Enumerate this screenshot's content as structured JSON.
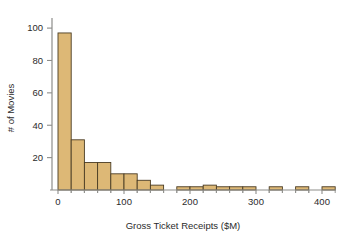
{
  "chart_data": {
    "type": "bar",
    "title": "",
    "subtitle": "",
    "xlabel": "Gross Ticket Receipts ($M)",
    "ylabel": "# of Movies",
    "xlim": [
      -10,
      430
    ],
    "ylim": [
      0,
      105
    ],
    "xticks": [
      0,
      100,
      200,
      300,
      400
    ],
    "xticklabels": [
      "0",
      "100",
      "200",
      "300",
      "400"
    ],
    "yticks": [
      20,
      40,
      60,
      80,
      100
    ],
    "yticklabels": [
      "20",
      "40",
      "60",
      "80",
      "100"
    ],
    "grid": false,
    "legend": null,
    "bin_width": 20,
    "bar_fill_color": "#ddb876",
    "bar_edge_color": "#4a3c24",
    "axis_color": "#8d8d8a",
    "text_color": "#2b2b2b",
    "background_color": "#ffffff",
    "categories": [
      "0-20",
      "20-40",
      "40-60",
      "60-80",
      "80-100",
      "100-120",
      "120-140",
      "140-160",
      "160-180",
      "180-200",
      "200-220",
      "220-240",
      "240-260",
      "260-280",
      "280-300",
      "300-320",
      "320-340",
      "340-360",
      "360-380",
      "380-400",
      "400-420"
    ],
    "bin_starts": [
      0,
      20,
      40,
      60,
      80,
      100,
      120,
      140,
      160,
      180,
      200,
      220,
      240,
      260,
      280,
      300,
      320,
      340,
      360,
      380,
      400
    ],
    "values": [
      97,
      31,
      17,
      17,
      10,
      10,
      6,
      3,
      0,
      2,
      2,
      3,
      2,
      2,
      2,
      0,
      2,
      0,
      2,
      0,
      2
    ],
    "xlabel_text": "Gross Ticket Receipts ($M)",
    "ylabel_text": "# of Movies"
  },
  "figure": {
    "name": "histogram-gross-ticket-receipts"
  }
}
